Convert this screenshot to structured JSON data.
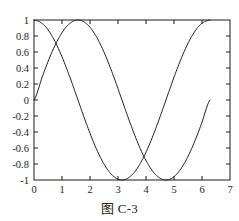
{
  "scan": {
    "header_fragment": "",
    "background": "#ffffff",
    "ink_color": "#1a1a1a"
  },
  "figure": {
    "caption": "图 C-3"
  },
  "chart_data": {
    "type": "line",
    "title": "",
    "xlabel": "",
    "ylabel": "",
    "xlim": [
      0,
      7
    ],
    "ylim": [
      -1,
      1
    ],
    "grid": false,
    "legend": "none",
    "frame": "box",
    "tick_direction": "in",
    "xticks": [
      0,
      1,
      2,
      3,
      4,
      5,
      6,
      7
    ],
    "xticklabels": [
      "0",
      "1",
      "2",
      "3",
      "4",
      "5",
      "6",
      "7"
    ],
    "yticks": [
      -1,
      -0.8,
      -0.6,
      -0.4,
      -0.2,
      0,
      0.2,
      0.4,
      0.6,
      0.8,
      1
    ],
    "yticklabels": [
      "-1",
      "-0.8",
      "-0.6",
      "-0.4",
      "-0.2",
      "0",
      "0.2",
      "0.4",
      "0.6",
      "0.8",
      "1"
    ],
    "series": [
      {
        "name": "sin(x)",
        "color": "#1a1a1a",
        "linewidth": 1,
        "domain": [
          0,
          6.2832
        ],
        "x": [
          0,
          0.3142,
          0.6283,
          0.9425,
          1.2566,
          1.5708,
          1.885,
          2.1991,
          2.5133,
          2.8274,
          3.1416,
          3.4558,
          3.7699,
          4.0841,
          4.3982,
          4.7124,
          5.0265,
          5.3407,
          5.6549,
          5.969,
          6.2832
        ],
        "values": [
          0,
          0.309,
          0.5878,
          0.809,
          0.9511,
          1,
          0.9511,
          0.809,
          0.5878,
          0.309,
          0,
          -0.309,
          -0.5878,
          -0.809,
          -0.9511,
          -1,
          -0.9511,
          -0.809,
          -0.5878,
          -0.309,
          0
        ]
      },
      {
        "name": "cos(x)",
        "color": "#1a1a1a",
        "linewidth": 1,
        "domain": [
          0,
          6.2832
        ],
        "x": [
          0,
          0.3142,
          0.6283,
          0.9425,
          1.2566,
          1.5708,
          1.885,
          2.1991,
          2.5133,
          2.8274,
          3.1416,
          3.4558,
          3.7699,
          4.0841,
          4.3982,
          4.7124,
          5.0265,
          5.3407,
          5.6549,
          5.969,
          6.2832
        ],
        "values": [
          1,
          0.9511,
          0.809,
          0.5878,
          0.309,
          0,
          -0.309,
          -0.5878,
          -0.809,
          -0.9511,
          -1,
          -0.9511,
          -0.809,
          -0.5878,
          -0.309,
          0,
          0.309,
          0.5878,
          0.809,
          0.9511,
          1
        ]
      }
    ]
  }
}
